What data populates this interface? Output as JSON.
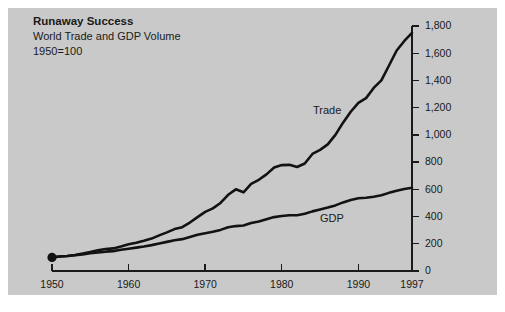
{
  "figure": {
    "background_color": "#ffffff",
    "panel_color": "#c9c9c9",
    "ink_color": "#121212"
  },
  "header": {
    "title": "Runaway Success",
    "subtitle": "World Trade and GDP Volume",
    "baseline_note": "1950=100"
  },
  "chart_data": {
    "type": "line",
    "title": "Runaway Success",
    "subtitle": "World Trade and GDP Volume",
    "annotations": [
      "1950=100"
    ],
    "xlabel": "",
    "ylabel": "",
    "xlim": [
      1950,
      1997
    ],
    "ylim": [
      0,
      1800
    ],
    "grid": false,
    "legend_position": "inline-labels",
    "y_axis_side": "right",
    "xticks": [
      1950,
      1960,
      1970,
      1980,
      1990,
      1997
    ],
    "xtick_labels": [
      "1950",
      "1960",
      "1970",
      "1980",
      "1990",
      "1997"
    ],
    "yticks": [
      0,
      200,
      400,
      600,
      800,
      1000,
      1200,
      1400,
      1600,
      1800
    ],
    "ytick_labels": [
      "0",
      "200",
      "400",
      "600",
      "800",
      "1,000",
      "1,200",
      "1,400",
      "1,600",
      "1,800"
    ],
    "x": [
      1950,
      1951,
      1952,
      1953,
      1954,
      1955,
      1956,
      1957,
      1958,
      1959,
      1960,
      1961,
      1962,
      1963,
      1964,
      1965,
      1966,
      1967,
      1968,
      1969,
      1970,
      1971,
      1972,
      1973,
      1974,
      1975,
      1976,
      1977,
      1978,
      1979,
      1980,
      1981,
      1982,
      1983,
      1984,
      1985,
      1986,
      1987,
      1988,
      1989,
      1990,
      1991,
      1992,
      1993,
      1994,
      1995,
      1996,
      1997
    ],
    "series": [
      {
        "name": "Trade",
        "label": "Trade",
        "values": [
          100,
          106,
          110,
          118,
          128,
          140,
          152,
          162,
          166,
          180,
          196,
          208,
          222,
          238,
          262,
          284,
          308,
          322,
          356,
          396,
          434,
          460,
          500,
          560,
          600,
          578,
          640,
          670,
          710,
          760,
          778,
          780,
          764,
          790,
          860,
          890,
          930,
          1000,
          1090,
          1170,
          1235,
          1270,
          1345,
          1400,
          1510,
          1620,
          1690,
          1750
        ],
        "endpoint_value": 1750
      },
      {
        "name": "GDP",
        "label": "GDP",
        "values": [
          100,
          106,
          110,
          116,
          122,
          130,
          136,
          142,
          146,
          156,
          164,
          172,
          180,
          190,
          202,
          214,
          226,
          234,
          250,
          266,
          278,
          288,
          302,
          322,
          330,
          334,
          352,
          364,
          380,
          396,
          404,
          410,
          410,
          420,
          438,
          452,
          466,
          482,
          504,
          522,
          534,
          538,
          546,
          556,
          574,
          590,
          602,
          612
        ],
        "endpoint_value": 612
      }
    ],
    "markers": [
      {
        "name": "origin-dot",
        "x": 1950,
        "y": 100
      }
    ]
  }
}
